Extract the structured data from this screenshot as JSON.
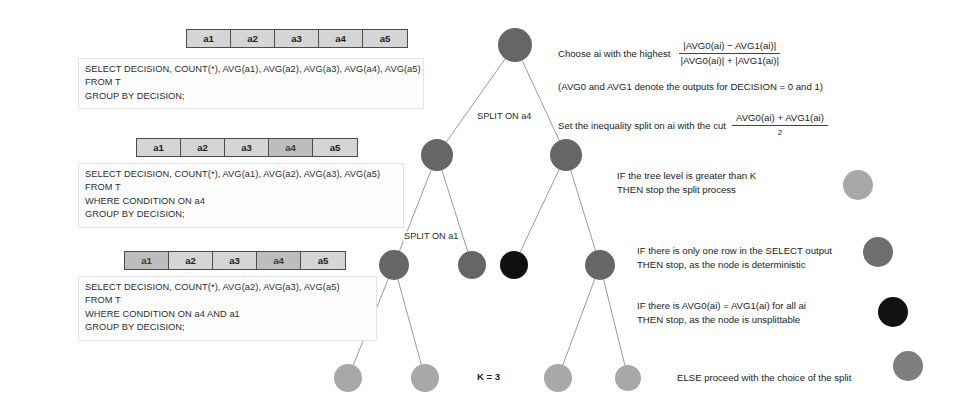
{
  "figure": {
    "k_label": "K = 3"
  },
  "colors": {
    "node_dark": "#666666",
    "node_black": "#101010",
    "node_light": "#a8a8a8",
    "node_mid": "#7e7e7e",
    "edge": "#8a8a8a",
    "table_fill": "#d5d5d5",
    "table_fill_dim": "#bdbdbd",
    "table_border": "#4d4d4d",
    "text": "#232323"
  },
  "sql_blocks": [
    {
      "id": "block-1",
      "attributes": [
        {
          "label": "a1",
          "dim": false
        },
        {
          "label": "a2",
          "dim": false
        },
        {
          "label": "a3",
          "dim": false
        },
        {
          "label": "a4",
          "dim": false
        },
        {
          "label": "a5",
          "dim": false
        }
      ],
      "lines": [
        "SELECT DECISION, COUNT(*), AVG(a1), AVG(a2), AVG(a3), AVG(a4), AVG(a5)",
        "FROM T",
        "GROUP BY DECISION;"
      ]
    },
    {
      "id": "block-2",
      "attributes": [
        {
          "label": "a1",
          "dim": false
        },
        {
          "label": "a2",
          "dim": false
        },
        {
          "label": "a3",
          "dim": false
        },
        {
          "label": "a4",
          "dim": true
        },
        {
          "label": "a5",
          "dim": false
        }
      ],
      "lines": [
        "SELECT DECISION, COUNT(*), AVG(a1), AVG(a2), AVG(a3), AVG(a5)",
        "FROM T",
        "WHERE CONDITION ON a4",
        "GROUP BY DECISION;"
      ]
    },
    {
      "id": "block-3",
      "attributes": [
        {
          "label": "a1",
          "dim": true
        },
        {
          "label": "a2",
          "dim": false
        },
        {
          "label": "a3",
          "dim": false
        },
        {
          "label": "a4",
          "dim": true
        },
        {
          "label": "a5",
          "dim": false
        }
      ],
      "lines": [
        "SELECT DECISION, COUNT(*), AVG(a2), AVG(a3), AVG(a5)",
        "FROM T",
        "WHERE CONDITION ON a4 AND a1",
        "GROUP BY DECISION;"
      ]
    }
  ],
  "tree": {
    "edge_labels": [
      {
        "text": "SPLIT ON a4",
        "x": 475,
        "y": 111
      },
      {
        "text": "SPLIT ON a1",
        "x": 402,
        "y": 231
      }
    ],
    "nodes": [
      {
        "id": "root",
        "cx": 515,
        "cy": 45,
        "r": 17,
        "shade": "dark"
      },
      {
        "id": "n-l",
        "cx": 437,
        "cy": 155,
        "r": 16,
        "shade": "dark"
      },
      {
        "id": "n-r",
        "cx": 566,
        "cy": 155,
        "r": 16,
        "shade": "dark"
      },
      {
        "id": "n-ll",
        "cx": 394,
        "cy": 265,
        "r": 15,
        "shade": "dark"
      },
      {
        "id": "n-lr",
        "cx": 472,
        "cy": 265,
        "r": 14,
        "shade": "dark"
      },
      {
        "id": "n-rl",
        "cx": 514,
        "cy": 265,
        "r": 14,
        "shade": "black"
      },
      {
        "id": "n-rr",
        "cx": 600,
        "cy": 265,
        "r": 15,
        "shade": "dark"
      },
      {
        "id": "n-b1",
        "cx": 348,
        "cy": 378,
        "r": 14,
        "shade": "light"
      },
      {
        "id": "n-b2",
        "cx": 425,
        "cy": 378,
        "r": 14,
        "shade": "light"
      },
      {
        "id": "n-b3",
        "cx": 558,
        "cy": 378,
        "r": 14,
        "shade": "light"
      },
      {
        "id": "n-b4",
        "cx": 628,
        "cy": 378,
        "r": 13,
        "shade": "light"
      }
    ],
    "edges": [
      {
        "from": "root",
        "to": "n-l"
      },
      {
        "from": "root",
        "to": "n-r"
      },
      {
        "from": "n-l",
        "to": "n-ll"
      },
      {
        "from": "n-l",
        "to": "n-lr"
      },
      {
        "from": "n-r",
        "to": "n-rl"
      },
      {
        "from": "n-r",
        "to": "n-rr"
      },
      {
        "from": "n-ll",
        "to": "n-b1"
      },
      {
        "from": "n-ll",
        "to": "n-b2"
      },
      {
        "from": "n-rr",
        "to": "n-b3"
      },
      {
        "from": "n-rr",
        "to": "n-b4"
      }
    ]
  },
  "formulas": {
    "choose": {
      "lead": "Choose ai with the highest",
      "numerator": "|AVG0(ai) − AVG1(ai)|",
      "denominator": "|AVG0(ai)| + |AVG1(ai)|"
    },
    "note": "(AVG0 and AVG1 denote the outputs for DECISION = 0 and 1)",
    "cut": {
      "lead": "Set the inequality split on ai with the cut",
      "numerator": "AVG0(ai) + AVG1(ai)",
      "denominator": "2"
    }
  },
  "rules": [
    {
      "id": "rule-level",
      "lines": [
        "IF the tree level is greater than K",
        "THEN stop the split process"
      ],
      "dot_shade": "light"
    },
    {
      "id": "rule-deterministic",
      "lines": [
        "IF there is only one row in the SELECT output",
        "THEN stop, as the node is deterministic"
      ],
      "dot_shade": "mid"
    },
    {
      "id": "rule-unsplittable",
      "lines": [
        "IF there is AVG0(ai) = AVG1(ai) for all ai",
        "THEN stop, as the node is unsplittable"
      ],
      "dot_shade": "black"
    },
    {
      "id": "rule-else",
      "lines": [
        "ELSE proceed with the choice of the split"
      ],
      "dot_shade": "mid"
    }
  ]
}
